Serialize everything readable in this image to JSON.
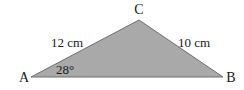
{
  "diagram": {
    "type": "triangle",
    "fill_color": "#a9a9a9",
    "stroke_color": "#6e6e6e",
    "vertices": {
      "A": {
        "label": "A",
        "x": 31,
        "y": 77
      },
      "B": {
        "label": "B",
        "x": 223,
        "y": 77
      },
      "C": {
        "label": "C",
        "x": 139,
        "y": 20
      }
    },
    "sides": {
      "AC": {
        "label": "12 cm"
      },
      "CB": {
        "label": "10 cm"
      }
    },
    "angles": {
      "A": {
        "label": "28°"
      }
    }
  }
}
